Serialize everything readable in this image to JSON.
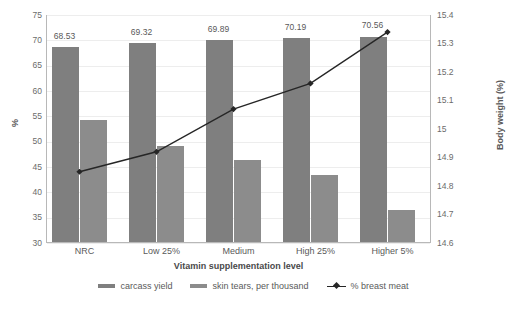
{
  "chart_data": {
    "type": "bar",
    "title": "",
    "xlabel": "Vitamin supplementation level",
    "ylabel": "%",
    "ylabel_right": "Body weight (%)",
    "categories": [
      "NRC",
      "Low 25%",
      "Medium",
      "High 25%",
      "Higher 5%"
    ],
    "ylim": [
      30,
      75
    ],
    "ylim_right": [
      14.6,
      15.4
    ],
    "yticks": [
      "30",
      "35",
      "40",
      "45",
      "50",
      "55",
      "60",
      "65",
      "70",
      "75"
    ],
    "yticks_right": [
      "14.6",
      "14.7",
      "14.8",
      "14.9",
      "15",
      "15.1",
      "15.2",
      "15.3",
      "15.4"
    ],
    "grid": true,
    "legend_position": "bottom",
    "series": [
      {
        "name": "carcass yield",
        "type": "bar",
        "axis": "left",
        "color": "#7f7f7f",
        "values": [
          68.53,
          69.32,
          69.89,
          70.19,
          70.56
        ],
        "data_labels": [
          "68.53",
          "69.32",
          "69.89",
          "70.19",
          "70.56"
        ]
      },
      {
        "name": "skin tears, per thousand",
        "type": "bar",
        "axis": "left",
        "color": "#8c8c8c",
        "values": [
          54.1,
          49.0,
          46.1,
          43.3,
          36.4
        ]
      },
      {
        "name": "% breast meat",
        "type": "line",
        "axis": "right",
        "color": "#262626",
        "values": [
          14.85,
          14.92,
          15.07,
          15.16,
          15.34
        ]
      }
    ]
  },
  "legend": {
    "items": [
      {
        "label": "carcass yield",
        "marker": "bar-swatch"
      },
      {
        "label": "skin tears, per thousand",
        "marker": "bar-swatch"
      },
      {
        "label": "% breast meat",
        "marker": "line-marker"
      }
    ]
  }
}
